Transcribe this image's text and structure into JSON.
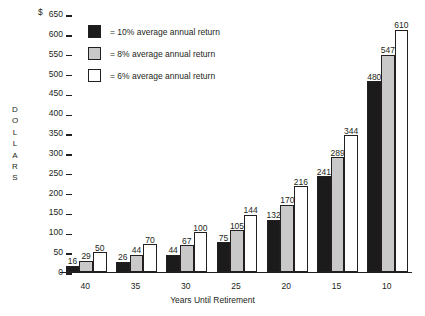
{
  "chart_data": {
    "type": "bar",
    "title": "",
    "xlabel": "Years Until Retirement",
    "ylabel": "DOLLARS",
    "currency_symbol": "$",
    "ylim": [
      0,
      650
    ],
    "ytick_labels": [
      "650",
      "600",
      "550",
      "500",
      "450",
      "400",
      "350",
      "300",
      "250",
      "200",
      "150",
      "100",
      "50",
      "0"
    ],
    "ytick_values": [
      650,
      600,
      550,
      500,
      450,
      400,
      350,
      300,
      250,
      200,
      150,
      100,
      50,
      0
    ],
    "grid": false,
    "legend_position": "top-left",
    "categories": [
      "40",
      "35",
      "30",
      "25",
      "20",
      "15",
      "10"
    ],
    "series": [
      {
        "name": "10% average annual return",
        "color": "#1c1b1b",
        "values": [
          16,
          26,
          44,
          75,
          132,
          241,
          480
        ]
      },
      {
        "name": "8% average annual return",
        "color": "#c9c9c9",
        "values": [
          29,
          44,
          67,
          105,
          170,
          289,
          547
        ]
      },
      {
        "name": "6% average annual return",
        "color": "#ffffff",
        "values": [
          50,
          70,
          100,
          144,
          216,
          344,
          610
        ]
      }
    ]
  },
  "legend": {
    "items": [
      {
        "label": "= 10% average annual return"
      },
      {
        "label": "= 8% average annual return"
      },
      {
        "label": "= 6% average annual return"
      }
    ]
  },
  "axis": {
    "y_title_letters": [
      "D",
      "O",
      "L",
      "L",
      "A",
      "R",
      "S"
    ]
  }
}
